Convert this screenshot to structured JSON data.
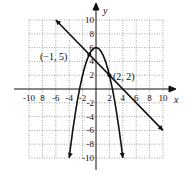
{
  "chart_data": {
    "type": "line",
    "title": "",
    "xlabel": "x",
    "ylabel": "y",
    "xlim": [
      -10,
      10
    ],
    "ylim": [
      -10,
      10
    ],
    "grid": true,
    "grid_step": 2,
    "x_ticks": [
      -10,
      -8,
      -6,
      -4,
      -2,
      2,
      4,
      6,
      8,
      10
    ],
    "y_ticks": [
      -10,
      -8,
      -6,
      -4,
      -2,
      2,
      4,
      6,
      8,
      10
    ],
    "x_tick_labels": [
      "-10",
      "8",
      "-6",
      "-4",
      "-2",
      "2",
      "4",
      "6",
      "8",
      "10"
    ],
    "y_tick_labels": [
      "-10",
      "-8",
      "-6",
      "-4",
      "-2",
      "2",
      "4",
      "6",
      "8",
      "10"
    ],
    "series": [
      {
        "name": "line",
        "equation": "y = -x + 4",
        "x": [
          -6,
          10
        ],
        "y": [
          10,
          -6
        ]
      },
      {
        "name": "parabola",
        "equation": "y = -x^2 + 6",
        "x": [
          -4,
          -3,
          -2,
          -1,
          0,
          1,
          2,
          3,
          4
        ],
        "y": [
          -10,
          -3,
          2,
          5,
          6,
          5,
          2,
          -3,
          -10
        ]
      }
    ],
    "annotations": [
      {
        "label": "(−1, 5)",
        "x": -1,
        "y": 5
      },
      {
        "label": "(2, 2)",
        "x": 2,
        "y": 2
      }
    ]
  },
  "labels": {
    "x_axis": "x",
    "y_axis": "y",
    "point_a": "(−1, 5)",
    "point_b": "(2, 2)"
  }
}
